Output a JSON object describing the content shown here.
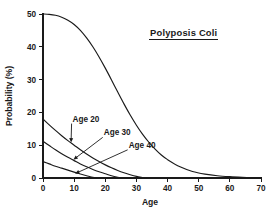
{
  "figure": {
    "background_color": "#ffffff",
    "ink_color": "#1a1a1a",
    "title": "Polyposis Coli"
  },
  "chart_data": {
    "type": "line",
    "title": "Polyposis Coli",
    "xlabel": "Age",
    "ylabel": "Probability (%)",
    "xlim": [
      0,
      70
    ],
    "ylim": [
      0,
      50
    ],
    "xticks": [
      0,
      10,
      20,
      30,
      40,
      50,
      60,
      70
    ],
    "yticks": [
      0,
      10,
      20,
      30,
      40,
      50
    ],
    "xtick_labels": [
      "0",
      "10",
      "20",
      "30",
      "40",
      "50",
      "60",
      "70"
    ],
    "ytick_labels": [
      "0",
      "10",
      "20",
      "30",
      "40",
      "50"
    ],
    "grid": false,
    "legend": "inline-annotations",
    "series": [
      {
        "name": "Birth",
        "label": "",
        "annotated": false,
        "x": [
          0,
          2,
          4,
          6,
          8,
          10,
          12,
          14,
          16,
          18,
          20,
          22,
          24,
          26,
          28,
          30,
          32,
          34,
          36,
          38,
          40,
          44,
          48,
          52,
          56,
          60,
          64,
          68,
          70
        ],
        "values": [
          50.0,
          49.9,
          49.6,
          49.0,
          48.1,
          46.8,
          45.0,
          42.7,
          40.0,
          36.9,
          33.5,
          29.9,
          26.2,
          22.6,
          19.2,
          16.1,
          13.3,
          10.9,
          8.8,
          7.0,
          5.6,
          3.4,
          2.0,
          1.2,
          0.7,
          0.4,
          0.2,
          0.05,
          0.0
        ]
      },
      {
        "name": "Age 20",
        "label": "Age 20",
        "annotated": true,
        "x": [
          0,
          2,
          4,
          6,
          8,
          10,
          12,
          14,
          16,
          18,
          20,
          22,
          24,
          26,
          28,
          30,
          32,
          33
        ],
        "values": [
          18.0,
          16.2,
          14.5,
          12.9,
          11.4,
          10.0,
          8.6,
          7.3,
          6.1,
          5.0,
          4.0,
          3.1,
          2.3,
          1.6,
          1.0,
          0.5,
          0.15,
          0.0
        ]
      },
      {
        "name": "Age 30",
        "label": "Age 30",
        "annotated": true,
        "x": [
          0,
          2,
          4,
          6,
          8,
          10,
          12,
          14,
          16,
          18,
          20,
          22,
          24,
          25
        ],
        "values": [
          11.2,
          9.9,
          8.6,
          7.4,
          6.3,
          5.3,
          4.3,
          3.4,
          2.6,
          1.9,
          1.3,
          0.7,
          0.2,
          0.0
        ]
      },
      {
        "name": "Age 40",
        "label": "Age 40",
        "annotated": true,
        "x": [
          0,
          2,
          4,
          6,
          8,
          10,
          12,
          14,
          16,
          17
        ],
        "values": [
          5.0,
          4.3,
          3.6,
          3.0,
          2.4,
          1.8,
          1.2,
          0.7,
          0.2,
          0.0
        ]
      }
    ],
    "annotations": [
      {
        "text": "Age 20",
        "text_x": 9.5,
        "text_y": 17.2,
        "target_x": 9.0,
        "target_y": 10.5
      },
      {
        "text": "Age 30",
        "text_x": 19.5,
        "text_y": 13.0,
        "target_x": 9.5,
        "target_y": 5.4
      },
      {
        "text": "Age 40",
        "text_x": 27.5,
        "text_y": 9.2,
        "target_x": 10.0,
        "target_y": 1.2
      }
    ]
  }
}
